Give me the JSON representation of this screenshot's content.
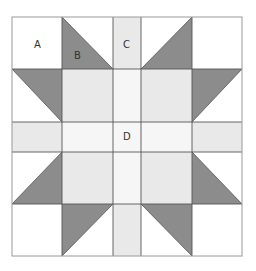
{
  "diagram": {
    "title": "",
    "colors": {
      "background": "#ffffff",
      "white": "#ffffff",
      "light": "#e9e9e9",
      "center": "#f6f6f6",
      "dark": "#8c8c8c",
      "line": "#555555",
      "outer_line": "#9a9a9a"
    },
    "grid": {
      "cols": [
        12,
        62,
        113,
        141,
        192,
        242
      ],
      "rows": [
        17,
        69,
        122,
        152,
        204,
        256
      ]
    },
    "labels": {
      "A": "A",
      "B": "B",
      "C": "C",
      "D": "D"
    },
    "pieces": [
      {
        "id": "corner-tl",
        "type": "square",
        "r": 0,
        "c": 0,
        "fill": "white"
      },
      {
        "id": "corner-tr",
        "type": "square",
        "r": 0,
        "c": 4,
        "fill": "white"
      },
      {
        "id": "corner-bl",
        "type": "square",
        "r": 4,
        "c": 0,
        "fill": "white"
      },
      {
        "id": "corner-br",
        "type": "square",
        "r": 4,
        "c": 4,
        "fill": "white"
      },
      {
        "id": "strip-top",
        "type": "rect",
        "r": 0,
        "c": 2,
        "fill": "light"
      },
      {
        "id": "strip-bottom",
        "type": "rect",
        "r": 4,
        "c": 2,
        "fill": "light"
      },
      {
        "id": "strip-left",
        "type": "rect",
        "r": 2,
        "c": 0,
        "fill": "light"
      },
      {
        "id": "strip-right",
        "type": "rect",
        "r": 2,
        "c": 4,
        "fill": "light"
      },
      {
        "id": "square-tl",
        "type": "square",
        "r": 1,
        "c": 1,
        "fill": "light"
      },
      {
        "id": "square-tr",
        "type": "square",
        "r": 1,
        "c": 3,
        "fill": "light"
      },
      {
        "id": "square-bl",
        "type": "square",
        "r": 3,
        "c": 1,
        "fill": "light"
      },
      {
        "id": "square-br",
        "type": "square",
        "r": 3,
        "c": 3,
        "fill": "light"
      },
      {
        "id": "cross-top",
        "type": "rect",
        "r": 1,
        "c": 2,
        "fill": "center"
      },
      {
        "id": "cross-bottom",
        "type": "rect",
        "r": 3,
        "c": 2,
        "fill": "center"
      },
      {
        "id": "cross-left",
        "type": "rect",
        "r": 2,
        "c": 1,
        "fill": "center"
      },
      {
        "id": "cross-right",
        "type": "rect",
        "r": 2,
        "c": 3,
        "fill": "center"
      },
      {
        "id": "center",
        "type": "square",
        "r": 2,
        "c": 2,
        "fill": "center"
      }
    ],
    "triangles": [
      {
        "id": "hst-top-left",
        "r": 0,
        "c": 1,
        "dark_half": "lower-left",
        "diagonal": "tl-br"
      },
      {
        "id": "hst-top-right",
        "r": 0,
        "c": 3,
        "dark_half": "lower-right",
        "diagonal": "bl-tr"
      },
      {
        "id": "hst-left-top",
        "r": 1,
        "c": 0,
        "dark_half": "upper-right",
        "diagonal": "tl-br"
      },
      {
        "id": "hst-right-top",
        "r": 1,
        "c": 4,
        "dark_half": "upper-left",
        "diagonal": "bl-tr"
      },
      {
        "id": "hst-left-bottom",
        "r": 3,
        "c": 0,
        "dark_half": "lower-right",
        "diagonal": "bl-tr"
      },
      {
        "id": "hst-right-bottom",
        "r": 3,
        "c": 4,
        "dark_half": "lower-left",
        "diagonal": "tl-br"
      },
      {
        "id": "hst-bottom-left",
        "r": 4,
        "c": 1,
        "dark_half": "upper-left",
        "diagonal": "bl-tr"
      },
      {
        "id": "hst-bottom-right",
        "r": 4,
        "c": 3,
        "dark_half": "upper-right",
        "diagonal": "tl-br"
      }
    ]
  }
}
